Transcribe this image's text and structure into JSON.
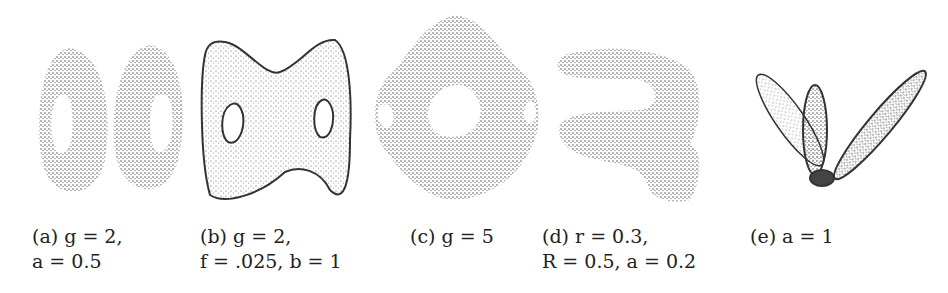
{
  "figure": {
    "subfigures": [
      {
        "id": "a",
        "shape": "two-hole torus point cloud (two separated ovals with holes)",
        "caption_line1": "(a) g = 2,",
        "caption_line2": "a = 0.5"
      },
      {
        "id": "b",
        "shape": "genus-2 bowtie surface with two holes",
        "caption_line1": "(b) g = 2,",
        "caption_line2": "f = .025, b = 1"
      },
      {
        "id": "c",
        "shape": "genus-5 surface (central hole with four side holes)",
        "caption_line1": "(c) g = 5",
        "caption_line2": ""
      },
      {
        "id": "d",
        "shape": "knotted tube point cloud",
        "caption_line1": "(d) r = 0.3,",
        "caption_line2": "R = 0.5, a = 0.2"
      },
      {
        "id": "e",
        "shape": "three-petal flower-like point cloud",
        "caption_line1": "(e) a = 1",
        "caption_line2": ""
      }
    ]
  },
  "colors": {
    "ink": "#333333",
    "background": "#ffffff"
  }
}
